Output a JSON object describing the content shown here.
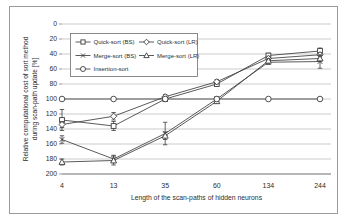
{
  "figure": {
    "border_color": "#9a9a9a",
    "background": "#ffffff"
  },
  "colors": {
    "line": "#3d3d3d",
    "grid": "#b4b4b4",
    "axis": "#6e6e6e",
    "text": "#2e2e2e",
    "marker_fill": "#ffffff"
  },
  "chart_data": {
    "type": "line",
    "title": "",
    "xlabel": "Length of the scan-paths of hidden neurons",
    "ylabel_line1": "Relative computational cost of sort method",
    "ylabel_line2": "during scan-path update [%]",
    "categories": [
      "4",
      "13",
      "35",
      "60",
      "134",
      "244"
    ],
    "y_ticks": [
      0,
      20,
      40,
      60,
      80,
      100,
      120,
      140,
      160,
      180,
      200
    ],
    "y_axis_inverted": true,
    "ylim": [
      0,
      200
    ],
    "grid": true,
    "legend_position": "top-left-inside",
    "legend_columns": 2,
    "series": [
      {
        "name": "Quick-sort (BS)",
        "marker": "square",
        "values": [
          128,
          136,
          100,
          80,
          42,
          36
        ],
        "error": [
          14,
          6,
          3,
          3,
          3,
          4
        ]
      },
      {
        "name": "Quick-sort (LR)",
        "marker": "diamond",
        "values": [
          134,
          123,
          97,
          77,
          46,
          41
        ],
        "error": [
          4,
          5,
          3,
          3,
          3,
          3
        ]
      },
      {
        "name": "Merge-sort (BS)",
        "marker": "x",
        "values": [
          154,
          180,
          146,
          100,
          51,
          50
        ],
        "error": [
          5,
          5,
          15,
          3,
          3,
          9
        ]
      },
      {
        "name": "Merge-sort (LR)",
        "marker": "triangle",
        "values": [
          184,
          182,
          149,
          103,
          49,
          46
        ],
        "error": [
          4,
          6,
          5,
          3,
          3,
          4
        ]
      },
      {
        "name": "Insertion-sort",
        "marker": "circle",
        "values": [
          100,
          100,
          100,
          100,
          100,
          100
        ],
        "error": [
          0,
          0,
          0,
          0,
          0,
          0
        ]
      }
    ]
  }
}
